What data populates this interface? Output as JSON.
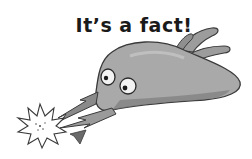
{
  "heading": "It’s a fact!",
  "illustration": {
    "subject": "cartoon-creature-with-electric-spark",
    "colors": {
      "body": "#a9a9a9",
      "body_shadow": "#7e7e7e",
      "outline": "#3a3a3a",
      "eye_white": "#f2f2f2",
      "spark": "#ffffff"
    }
  }
}
